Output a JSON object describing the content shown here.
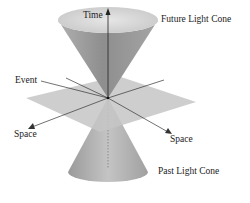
{
  "diagram": {
    "labels": {
      "time": "Time",
      "future_cone": "Future Light Cone",
      "event": "Event",
      "space_left": "Space",
      "space_right": "Space",
      "past_cone": "Past Light Cone"
    },
    "colors": {
      "cone_light": "#d8d8d8",
      "cone_dark": "#8c8c8c",
      "plane": "#c8c8c8",
      "axis": "#333333"
    }
  }
}
